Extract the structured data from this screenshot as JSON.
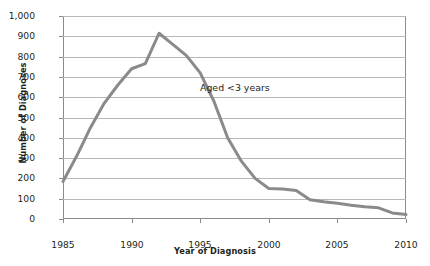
{
  "chart_data": {
    "type": "line",
    "title": "",
    "subtitle": "",
    "xlabel": "Year of Diagnosis",
    "ylabel": "Number of Diagnoses",
    "xlim": [
      1985,
      2010
    ],
    "ylim": [
      0,
      1000
    ],
    "grid": "horizontal",
    "legend": "none",
    "line_color": "#8a8a8a",
    "gridline_color": "#b7b7b7",
    "axis_color": "#8c8c8c",
    "text_color": "#231f20",
    "y_ticks": [
      {
        "value": 0,
        "label": "0"
      },
      {
        "value": 100,
        "label": "100"
      },
      {
        "value": 200,
        "label": "200"
      },
      {
        "value": 300,
        "label": "300"
      },
      {
        "value": 400,
        "label": "400"
      },
      {
        "value": 500,
        "label": "500"
      },
      {
        "value": 600,
        "label": "600"
      },
      {
        "value": 700,
        "label": "700"
      },
      {
        "value": 800,
        "label": "800"
      },
      {
        "value": 900,
        "label": "900"
      },
      {
        "value": 1000,
        "label": "1,000"
      }
    ],
    "x_ticks": [
      {
        "value": 1985,
        "label": "1985"
      },
      {
        "value": 1990,
        "label": "1990"
      },
      {
        "value": 1995,
        "label": "1995"
      },
      {
        "value": 2000,
        "label": "2000"
      },
      {
        "value": 2005,
        "label": "2005"
      },
      {
        "value": 2010,
        "label": "2010"
      }
    ],
    "series": [
      {
        "name": "Aged <3 years",
        "color": "#8a8a8a",
        "x": [
          1985,
          1986,
          1987,
          1988,
          1989,
          1990,
          1991,
          1992,
          1993,
          1994,
          1995,
          1996,
          1997,
          1998,
          1999,
          2000,
          2001,
          2002,
          2003,
          2004,
          2005,
          2006,
          2007,
          2008,
          2009,
          2010
        ],
        "values": [
          185,
          310,
          450,
          570,
          660,
          740,
          765,
          915,
          860,
          805,
          720,
          580,
          400,
          285,
          200,
          150,
          148,
          140,
          95,
          85,
          78,
          68,
          60,
          55,
          30,
          22
        ]
      }
    ],
    "annotations": [
      {
        "text": "Aged <3 years",
        "x": 1995.0,
        "y": 645
      }
    ]
  }
}
